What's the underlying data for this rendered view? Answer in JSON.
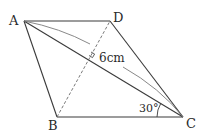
{
  "diagram": {
    "type": "rhombus-geometry",
    "vertices": {
      "A": {
        "label": "A",
        "x": 24,
        "y": 21
      },
      "B": {
        "label": "B",
        "x": 57,
        "y": 117
      },
      "C": {
        "label": "C",
        "x": 183,
        "y": 117
      },
      "D": {
        "label": "D",
        "x": 110,
        "y": 21
      }
    },
    "length_label": "6cm",
    "angle_label": "30°",
    "colors": {
      "line": "#3a3a3a",
      "dashed": "#6a6a6a",
      "arc": "#7a7a7a",
      "text": "#2a2a2a"
    }
  }
}
